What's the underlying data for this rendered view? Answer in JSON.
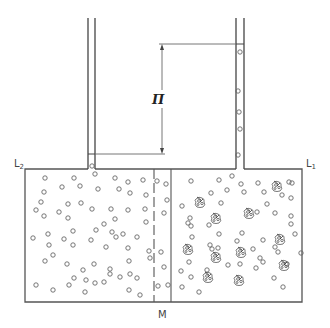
{
  "diagram": {
    "labels": {
      "left_level": "L2",
      "left_level_base": "L",
      "left_level_sub": "2",
      "right_level": "L1",
      "right_level_base": "L",
      "right_level_sub": "1",
      "pressure": "Π",
      "membrane": "M"
    },
    "colors": {
      "stroke": "#555555",
      "background": "#ffffff",
      "particle": "#666666"
    },
    "vessel": {
      "left": 25,
      "right": 302,
      "top": 169,
      "bottom": 302
    },
    "left_tube": {
      "x1": 88,
      "x2": 95,
      "top": 18,
      "liquid_level": 154
    },
    "right_tube": {
      "x1": 236,
      "x2": 244,
      "top": 18,
      "liquid_level": 44
    },
    "membrane": {
      "dashed_x": 154,
      "solid_x": 171
    },
    "dimension": {
      "x": 162,
      "y_top": 44,
      "y_bottom": 154
    },
    "solvent_particles_left": [
      [
        45,
        178
      ],
      [
        74,
        178
      ],
      [
        80,
        186
      ],
      [
        95,
        174
      ],
      [
        115,
        178
      ],
      [
        128,
        182
      ],
      [
        143,
        180
      ],
      [
        44,
        192
      ],
      [
        62,
        187
      ],
      [
        98,
        189
      ],
      [
        119,
        189
      ],
      [
        130,
        193
      ],
      [
        146,
        195
      ],
      [
        41,
        202
      ],
      [
        68,
        204
      ],
      [
        81,
        203
      ],
      [
        36,
        210
      ],
      [
        44,
        216
      ],
      [
        59,
        212
      ],
      [
        68,
        218
      ],
      [
        92,
        209
      ],
      [
        111,
        209
      ],
      [
        128,
        210
      ],
      [
        145,
        209
      ],
      [
        115,
        219
      ],
      [
        104,
        224
      ],
      [
        146,
        222
      ],
      [
        73,
        231
      ],
      [
        96,
        230
      ],
      [
        112,
        232
      ],
      [
        123,
        234
      ],
      [
        33,
        238
      ],
      [
        48,
        234
      ],
      [
        64,
        239
      ],
      [
        91,
        240
      ],
      [
        116,
        237
      ],
      [
        137,
        237
      ],
      [
        49,
        245
      ],
      [
        73,
        245
      ],
      [
        106,
        247
      ],
      [
        128,
        248
      ],
      [
        53,
        255
      ],
      [
        45,
        261
      ],
      [
        67,
        264
      ],
      [
        94,
        264
      ],
      [
        110,
        269
      ],
      [
        129,
        261
      ],
      [
        149,
        251
      ],
      [
        150,
        258
      ],
      [
        83,
        270
      ],
      [
        110,
        274
      ],
      [
        120,
        277
      ],
      [
        130,
        274
      ],
      [
        137,
        278
      ],
      [
        74,
        278
      ],
      [
        86,
        280
      ],
      [
        95,
        283
      ],
      [
        104,
        282
      ],
      [
        36,
        285
      ],
      [
        53,
        290
      ],
      [
        69,
        285
      ],
      [
        85,
        292
      ],
      [
        129,
        290
      ],
      [
        140,
        295
      ]
    ],
    "solvent_particles_right": [
      [
        166,
        184
      ],
      [
        157,
        181
      ],
      [
        167,
        200
      ],
      [
        164,
        213
      ],
      [
        161,
        252
      ],
      [
        164,
        267
      ],
      [
        168,
        285
      ],
      [
        158,
        286
      ]
    ],
    "solvent_particles_tube": [
      [
        92,
        166
      ],
      [
        240,
        52
      ],
      [
        238,
        91
      ],
      [
        239,
        112
      ],
      [
        240,
        129
      ],
      [
        238,
        155
      ]
    ],
    "solvent_particles_solution": [
      [
        191,
        181
      ],
      [
        219,
        180
      ],
      [
        232,
        176
      ],
      [
        241,
        184
      ],
      [
        244,
        192
      ],
      [
        258,
        183
      ],
      [
        264,
        192
      ],
      [
        289,
        182
      ],
      [
        211,
        193
      ],
      [
        227,
        190
      ],
      [
        267,
        204
      ],
      [
        282,
        195
      ],
      [
        292,
        183
      ],
      [
        291,
        198
      ],
      [
        182,
        206
      ],
      [
        190,
        218
      ],
      [
        188,
        223
      ],
      [
        221,
        203
      ],
      [
        257,
        212
      ],
      [
        275,
        213
      ],
      [
        191,
        226
      ],
      [
        209,
        225
      ],
      [
        219,
        234
      ],
      [
        192,
        237
      ],
      [
        210,
        245
      ],
      [
        237,
        241
      ],
      [
        242,
        233
      ],
      [
        263,
        240
      ],
      [
        275,
        247
      ],
      [
        295,
        234
      ],
      [
        291,
        216
      ],
      [
        291,
        224
      ],
      [
        301,
        253
      ],
      [
        287,
        264
      ],
      [
        218,
        248
      ],
      [
        212,
        249
      ],
      [
        253,
        249
      ],
      [
        260,
        258
      ],
      [
        278,
        252
      ],
      [
        181,
        271
      ],
      [
        189,
        262
      ],
      [
        191,
        277
      ],
      [
        207,
        270
      ],
      [
        228,
        265
      ],
      [
        240,
        264
      ],
      [
        256,
        268
      ],
      [
        263,
        262
      ],
      [
        274,
        278
      ],
      [
        283,
        287
      ],
      [
        182,
        287
      ],
      [
        199,
        292
      ]
    ],
    "solute_molecules": [
      [
        200,
        202
      ],
      [
        216,
        218
      ],
      [
        249,
        213
      ],
      [
        277,
        186
      ],
      [
        280,
        239
      ],
      [
        188,
        249
      ],
      [
        216,
        257
      ],
      [
        241,
        252
      ],
      [
        284,
        265
      ],
      [
        208,
        277
      ],
      [
        239,
        280
      ]
    ]
  }
}
